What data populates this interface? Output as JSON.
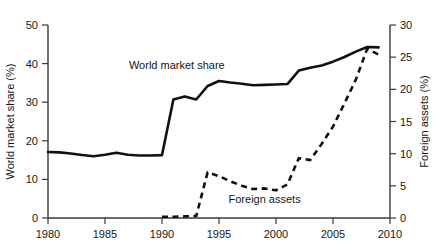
{
  "chart_data": {
    "type": "line",
    "title": "",
    "xlabel": "",
    "grid": false,
    "legend_position": "inline-annotations",
    "x": [
      1980,
      1981,
      1982,
      1983,
      1984,
      1985,
      1986,
      1987,
      1988,
      1989,
      1990,
      1991,
      1992,
      1993,
      1994,
      1995,
      1996,
      1997,
      1998,
      1999,
      2000,
      2001,
      2002,
      2003,
      2004,
      2005,
      2006,
      2007,
      2008,
      2009
    ],
    "xlim": [
      1980,
      2010
    ],
    "xticks": [
      1980,
      1985,
      1990,
      1995,
      2000,
      2005,
      2010
    ],
    "xticklabels": [
      "1980",
      "1985",
      "1990",
      "1995",
      "2000",
      "2005",
      "2010"
    ],
    "axes": [
      {
        "id": "left",
        "label": "World market share (%)",
        "lim": [
          0,
          50
        ],
        "ticks": [
          0,
          10,
          20,
          30,
          40,
          50
        ],
        "ticklabels": [
          "0",
          "10",
          "20",
          "30",
          "40",
          "50"
        ]
      },
      {
        "id": "right",
        "label": "Foreign assets (%)",
        "lim": [
          0,
          30
        ],
        "ticks": [
          0,
          5,
          10,
          15,
          20,
          25,
          30
        ],
        "ticklabels": [
          "0",
          "5",
          "10",
          "15",
          "20",
          "25",
          "30"
        ]
      }
    ],
    "series": [
      {
        "name": "World market share",
        "axis": "left",
        "style": "solid",
        "annotation": "World market share",
        "annotation_x": 1991.3,
        "annotation_y": 38.6,
        "values": [
          17.1,
          17.0,
          16.7,
          16.3,
          16.0,
          16.4,
          16.9,
          16.4,
          16.2,
          16.2,
          16.3,
          30.7,
          31.5,
          30.7,
          34.2,
          35.5,
          35.1,
          34.8,
          34.4,
          34.5,
          34.6,
          34.7,
          38.2,
          38.9,
          39.5,
          40.5,
          41.7,
          43.1,
          44.3,
          44.2
        ]
      },
      {
        "name": "Foreign assets",
        "axis": "right",
        "style": "dashed",
        "annotation": "Foreign assets",
        "annotation_x": 1999.0,
        "annotation_y": 2.35,
        "values": [
          null,
          null,
          null,
          null,
          null,
          null,
          null,
          null,
          null,
          null,
          0.2,
          0.2,
          0.25,
          0.3,
          7.1,
          6.5,
          5.7,
          5.0,
          4.5,
          4.6,
          4.3,
          5.2,
          9.3,
          9.0,
          11.5,
          14.2,
          17.8,
          21.5,
          26.3,
          25.4
        ]
      }
    ]
  },
  "annotations": {
    "world_market_share": "World market share",
    "foreign_assets": "Foreign assets"
  }
}
